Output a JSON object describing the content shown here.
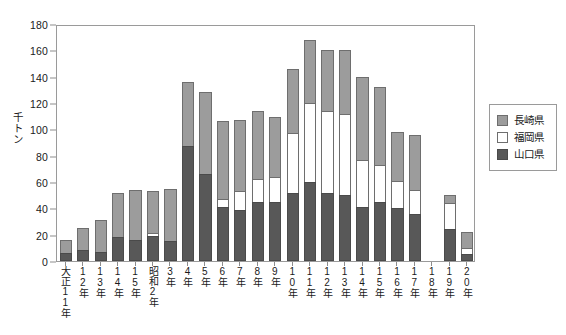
{
  "chart_data": {
    "type": "bar",
    "stacked": true,
    "title": "",
    "xlabel": "",
    "ylabel": "千トン",
    "ylim": [
      0,
      180
    ],
    "ytick_step": 20,
    "yticks": [
      0,
      20,
      40,
      60,
      80,
      100,
      120,
      140,
      160,
      180
    ],
    "grid": false,
    "legend_position": "right",
    "categories": [
      "大正11年",
      "12年",
      "13年",
      "14年",
      "15年",
      "昭和2年",
      "3年",
      "4年",
      "5年",
      "6年",
      "7年",
      "8年",
      "9年",
      "10年",
      "11年",
      "12年",
      "13年",
      "14年",
      "15年",
      "16年",
      "17年",
      "18年",
      "19年",
      "20年"
    ],
    "series": [
      {
        "name": "山口県",
        "color": "#585858",
        "values": [
          6,
          8,
          7,
          18,
          16,
          19,
          15,
          87,
          66,
          41,
          39,
          45,
          45,
          52,
          60,
          52,
          50,
          41,
          45,
          40,
          36,
          0,
          24,
          5
        ]
      },
      {
        "name": "福岡県",
        "color": "#ffffff",
        "values": [
          0,
          0,
          0,
          0,
          0,
          2,
          0,
          0,
          0,
          6,
          14,
          17,
          19,
          45,
          60,
          62,
          62,
          36,
          28,
          21,
          18,
          0,
          20,
          5
        ]
      },
      {
        "name": "長崎県",
        "color": "#9c9c9c",
        "values": [
          10,
          17,
          24,
          34,
          38,
          32,
          40,
          49,
          62,
          59,
          54,
          52,
          45,
          49,
          48,
          46,
          48,
          63,
          59,
          37,
          42,
          0,
          6,
          12
        ]
      }
    ],
    "totals": [
      16,
      25,
      31,
      52,
      54,
      53,
      55,
      136,
      128,
      106,
      107,
      114,
      109,
      146,
      168,
      160,
      160,
      140,
      132,
      98,
      96,
      0,
      50,
      22
    ]
  },
  "legend": {
    "items": [
      {
        "label": "長崎県",
        "swatch": "nagasaki-swatch"
      },
      {
        "label": "福岡県",
        "swatch": "fukuoka-swatch"
      },
      {
        "label": "山口県",
        "swatch": "yamaguchi-swatch"
      }
    ]
  }
}
